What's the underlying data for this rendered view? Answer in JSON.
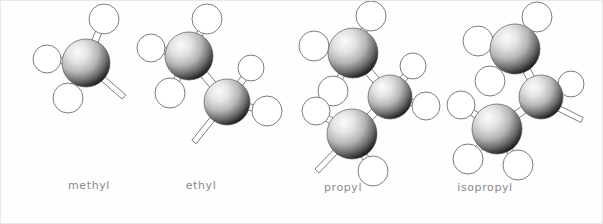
{
  "figure": {
    "background_color": "#fefefe",
    "border_color": "#e8e8e8",
    "width": 603,
    "height": 224
  },
  "style": {
    "carbon_color_light": "#f2f2f2",
    "carbon_color_mid": "#9a9a9a",
    "carbon_color_dark": "#1a1a1a",
    "hydrogen_color": "#ffffff",
    "hydrogen_outline": "#7d7d7d",
    "bond_color": "#ffffff",
    "bond_outline": "#6e6e6e",
    "label_color": "#8a8a8a"
  },
  "labels": {
    "methyl": "methyl",
    "ethyl": "ethyl",
    "propyl": "propyl",
    "isopropyl": "isopropyl"
  },
  "molecules": [
    {
      "name": "methyl",
      "label": "methyl",
      "formula": "-CH3",
      "carbons": [
        {
          "id": "C1",
          "cx": 85,
          "cy": 62,
          "r": 24
        }
      ],
      "hydrogens": [
        {
          "id": "H1",
          "cx": 103,
          "cy": 18,
          "r": 15,
          "bond_to": "C1"
        },
        {
          "id": "H2",
          "cx": 46,
          "cy": 58,
          "r": 14,
          "bond_to": "C1"
        },
        {
          "id": "H3",
          "cx": 67,
          "cy": 97,
          "r": 15,
          "bond_to": "C1"
        }
      ],
      "open_bonds": [
        {
          "from": "C1",
          "x1": 100,
          "y1": 76,
          "x2": 123,
          "y2": 96
        }
      ]
    },
    {
      "name": "ethyl",
      "label": "ethyl",
      "formula": "-CH2CH3",
      "carbons": [
        {
          "id": "C1",
          "cx": 188,
          "cy": 55,
          "r": 24
        },
        {
          "id": "C2",
          "cx": 226,
          "cy": 101,
          "r": 23
        }
      ],
      "hydrogens": [
        {
          "id": "H1",
          "cx": 206,
          "cy": 18,
          "r": 15,
          "bond_to": "C1"
        },
        {
          "id": "H2",
          "cx": 150,
          "cy": 47,
          "r": 14,
          "bond_to": "C1"
        },
        {
          "id": "H3",
          "cx": 169,
          "cy": 92,
          "r": 15,
          "bond_to": "C1"
        },
        {
          "id": "H4",
          "cx": 250,
          "cy": 67,
          "r": 13,
          "bond_to": "C2"
        },
        {
          "id": "H5",
          "cx": 266,
          "cy": 110,
          "r": 15,
          "bond_to": "C2"
        }
      ],
      "bonds": [
        {
          "from": "C1",
          "to": "C2"
        }
      ],
      "open_bonds": [
        {
          "from": "C2",
          "x1": 213,
          "y1": 116,
          "x2": 193,
          "y2": 141
        }
      ]
    },
    {
      "name": "propyl",
      "label": "propyl",
      "formula": "-CH2CH2CH3",
      "carbons": [
        {
          "id": "C1",
          "cx": 352,
          "cy": 52,
          "r": 25
        },
        {
          "id": "C2",
          "cx": 389,
          "cy": 96,
          "r": 22
        },
        {
          "id": "C3",
          "cx": 351,
          "cy": 133,
          "r": 25
        }
      ],
      "hydrogens": [
        {
          "id": "H1",
          "cx": 370,
          "cy": 15,
          "r": 15,
          "bond_to": "C1"
        },
        {
          "id": "H2",
          "cx": 313,
          "cy": 45,
          "r": 15,
          "bond_to": "C1"
        },
        {
          "id": "H3",
          "cx": 332,
          "cy": 90,
          "r": 15,
          "bond_to": "C1"
        },
        {
          "id": "H4",
          "cx": 412,
          "cy": 65,
          "r": 13,
          "bond_to": "C2"
        },
        {
          "id": "H5",
          "cx": 425,
          "cy": 105,
          "r": 14,
          "bond_to": "C2"
        },
        {
          "id": "H6",
          "cx": 315,
          "cy": 110,
          "r": 14,
          "bond_to": "C3"
        },
        {
          "id": "H7",
          "cx": 372,
          "cy": 170,
          "r": 15,
          "bond_to": "C3"
        }
      ],
      "bonds": [
        {
          "from": "C1",
          "to": "C2"
        },
        {
          "from": "C2",
          "to": "C3"
        }
      ],
      "open_bonds": [
        {
          "from": "C3",
          "x1": 337,
          "y1": 148,
          "x2": 316,
          "y2": 170
        }
      ]
    },
    {
      "name": "isopropyl",
      "label": "isopropyl",
      "formula": "-CH(CH3)2",
      "carbons": [
        {
          "id": "C1",
          "cx": 514,
          "cy": 48,
          "r": 25
        },
        {
          "id": "C2",
          "cx": 540,
          "cy": 96,
          "r": 22
        },
        {
          "id": "C3",
          "cx": 496,
          "cy": 128,
          "r": 25
        }
      ],
      "hydrogens": [
        {
          "id": "H1",
          "cx": 536,
          "cy": 16,
          "r": 15,
          "bond_to": "C1"
        },
        {
          "id": "H2",
          "cx": 477,
          "cy": 40,
          "r": 15,
          "bond_to": "C1"
        },
        {
          "id": "H3",
          "cx": 489,
          "cy": 80,
          "r": 15,
          "bond_to": "C1"
        },
        {
          "id": "H4",
          "cx": 570,
          "cy": 83,
          "r": 13,
          "bond_to": "C2"
        },
        {
          "id": "H5",
          "cx": 460,
          "cy": 104,
          "r": 14,
          "bond_to": "C3"
        },
        {
          "id": "H6",
          "cx": 467,
          "cy": 158,
          "r": 15,
          "bond_to": "C3"
        },
        {
          "id": "H7",
          "cx": 517,
          "cy": 164,
          "r": 15,
          "bond_to": "C3"
        }
      ],
      "bonds": [
        {
          "from": "C1",
          "to": "C2"
        },
        {
          "from": "C2",
          "to": "C3"
        }
      ],
      "open_bonds": [
        {
          "from": "C2",
          "x1": 557,
          "y1": 107,
          "x2": 581,
          "y2": 119
        }
      ]
    }
  ]
}
